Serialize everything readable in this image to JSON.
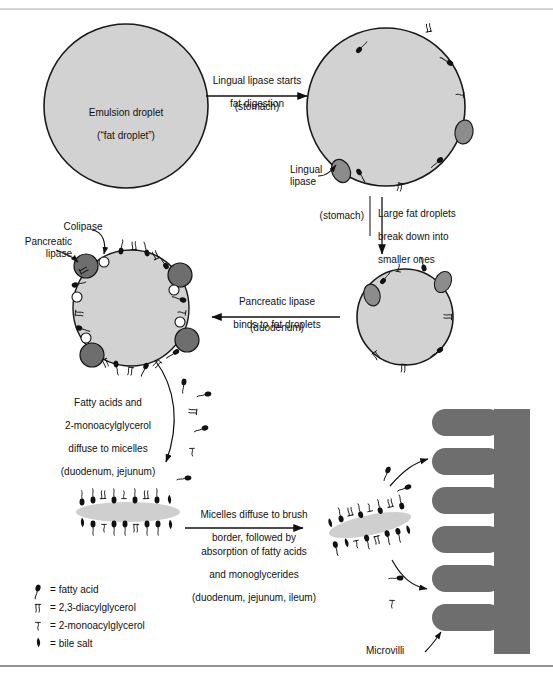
{
  "figure": {
    "title_visible": false,
    "colors": {
      "droplet_fill": "#d2d2d2",
      "droplet_stroke": "#1a1a1a",
      "lipase_fill": "#8c8c8c",
      "colipase_fill": "#ffffff",
      "micelle_fill": "#cfcfcf",
      "microvilli_fill": "#6e6e6e",
      "rule": "#9b9b9b",
      "ink": "#111111"
    }
  },
  "steps": {
    "emulsion_droplet": {
      "line1": "Emulsion droplet",
      "line2": "(“fat droplet”)"
    },
    "arrow1": {
      "above_line1": "Lingual lipase starts",
      "above_line2": "fat digestion",
      "below": "(stomach)",
      "direction": "right"
    },
    "arrow2": {
      "left_note": "(stomach)",
      "right_line1": "Large fat droplets",
      "right_line2": "break down into",
      "right_line3": "smaller ones",
      "direction": "down"
    },
    "arrow3": {
      "above_line1": "Pancreatic lipase",
      "above_line2": "binds to fat droplets",
      "below": "(duodenum)",
      "direction": "left"
    },
    "arrow4": {
      "line1": "Fatty acids and",
      "line2": "2-monoacylglycerol",
      "line3": "diffuse to micelles",
      "line4": "(duodenum, jejunum)",
      "direction": "curve-down"
    },
    "arrow5": {
      "above_line1": "Micelles diffuse to brush",
      "above_line2": "border, followed by",
      "below_line1": "absorption of fatty acids",
      "below_line2": "and monoglycerides",
      "below_line3": "(duodenum, jejunum, ileum)",
      "direction": "right"
    }
  },
  "callouts": {
    "lingual_lipase": "Lingual\nlipase",
    "pancreatic_lipase": "Pancreatic\nlipase",
    "colipase": "Colipase",
    "microvilli": "Microvilli"
  },
  "legend": {
    "items": [
      {
        "symbol": "fatty-acid-glyph",
        "equals": "=",
        "label": "fatty acid"
      },
      {
        "symbol": "diacylglycerol-glyph",
        "equals": "=",
        "label": "2,3-diacylglycerol"
      },
      {
        "symbol": "monoacylglycerol-glyph",
        "equals": "=",
        "label": "2-monoacylglycerol"
      },
      {
        "symbol": "bile-salt-glyph",
        "equals": "=",
        "label": "bile salt"
      }
    ]
  }
}
